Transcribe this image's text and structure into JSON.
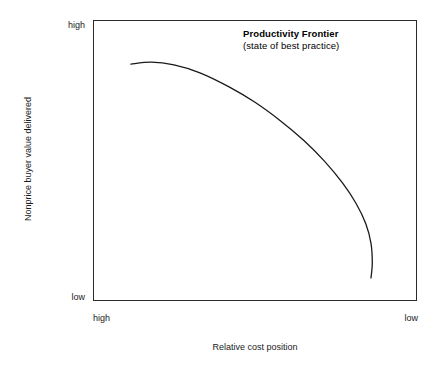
{
  "chart_data": {
    "type": "line",
    "title": "",
    "xlabel": "Relative cost position",
    "ylabel": "Nonprice buyer value delivered",
    "x_tick_labels": [
      "high",
      "low"
    ],
    "y_tick_labels": [
      "high",
      "low"
    ],
    "xlim": [
      "high",
      "low"
    ],
    "ylim": [
      "low",
      "high"
    ],
    "grid": false,
    "legend": "none",
    "annotations": [
      {
        "name": "productivity-frontier-label",
        "title": "Productivity Frontier",
        "subtitle": "(state of best practice)",
        "position": "upper-right-inside-plot"
      }
    ],
    "series": [
      {
        "name": "Productivity Frontier",
        "style": "solid",
        "color": "#1a1a1a",
        "width": 1.3,
        "description": "Concave Pareto frontier: nearly flat at high cost position / high buyer value, falling steeply toward low cost position.",
        "points": [
          {
            "x": 0.117,
            "y": 0.843
          },
          {
            "x": 0.18,
            "y": 0.85
          },
          {
            "x": 0.25,
            "y": 0.84
          },
          {
            "x": 0.33,
            "y": 0.812
          },
          {
            "x": 0.42,
            "y": 0.762
          },
          {
            "x": 0.5,
            "y": 0.707
          },
          {
            "x": 0.58,
            "y": 0.64
          },
          {
            "x": 0.65,
            "y": 0.572
          },
          {
            "x": 0.715,
            "y": 0.497
          },
          {
            "x": 0.77,
            "y": 0.42
          },
          {
            "x": 0.812,
            "y": 0.347
          },
          {
            "x": 0.842,
            "y": 0.275
          },
          {
            "x": 0.858,
            "y": 0.205
          },
          {
            "x": 0.862,
            "y": 0.135
          },
          {
            "x": 0.858,
            "y": 0.082
          }
        ]
      }
    ]
  },
  "figure": {
    "background_color": "#ffffff",
    "frame_color": "#2b2b2b",
    "text_color": "#1a1a1a",
    "curve_color": "#1a1a1a"
  },
  "axes": {
    "y": {
      "title": "Nonprice buyer value delivered",
      "top_label": "high",
      "bottom_label": "low"
    },
    "x": {
      "title": "Relative cost position",
      "left_label": "high",
      "right_label": "low"
    }
  },
  "annotation": {
    "title": "Productivity Frontier",
    "subtitle": "(state of best practice)"
  }
}
